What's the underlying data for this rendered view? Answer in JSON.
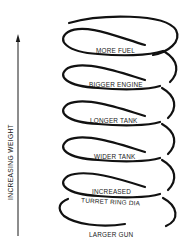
{
  "axis": {
    "label": "INCREASING WEIGHT",
    "direction": "up"
  },
  "coils": [
    {
      "label": "MORE FUEL"
    },
    {
      "label": "BIGGER ENGINE"
    },
    {
      "label": "LONGER TANK"
    },
    {
      "label": "WIDER TANK"
    },
    {
      "label": "INCREASED",
      "label2": "TURRET RING DIA"
    },
    {
      "label": "LARGER GUN"
    }
  ],
  "colors": {
    "line": "#111111",
    "background": "#ffffff"
  }
}
